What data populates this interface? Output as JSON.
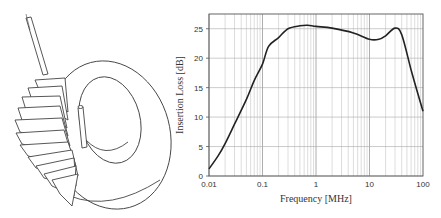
{
  "figure": {
    "left_panel": {
      "description": "toroidal-inductor-illustration"
    },
    "right_panel": {
      "description": "insertion-loss-chart"
    }
  },
  "chart_data": {
    "type": "line",
    "title": "",
    "xlabel": "Frequency [MHz]",
    "ylabel": "Insertion Loss [dB]",
    "xscale": "log",
    "xlim": [
      0.01,
      100
    ],
    "ylim": [
      0,
      27.5
    ],
    "xticks": [
      "0.01",
      "0.1",
      "1",
      "10",
      "100"
    ],
    "yticks": [
      "0",
      "5",
      "10",
      "15",
      "20",
      "25"
    ],
    "grid": true,
    "legend": null,
    "series": [
      {
        "name": "Insertion Loss",
        "x": [
          0.01,
          0.015,
          0.02,
          0.03,
          0.05,
          0.07,
          0.1,
          0.13,
          0.2,
          0.3,
          0.5,
          0.7,
          1,
          2,
          5,
          10,
          15,
          20,
          30,
          40,
          60,
          80,
          100
        ],
        "values": [
          1.2,
          3.5,
          5.5,
          8.8,
          13,
          16.2,
          19,
          22,
          23.5,
          25,
          25.5,
          25.6,
          25.4,
          25.1,
          24.3,
          23.2,
          23.2,
          23.8,
          25.1,
          24,
          18,
          14,
          11
        ]
      }
    ]
  }
}
